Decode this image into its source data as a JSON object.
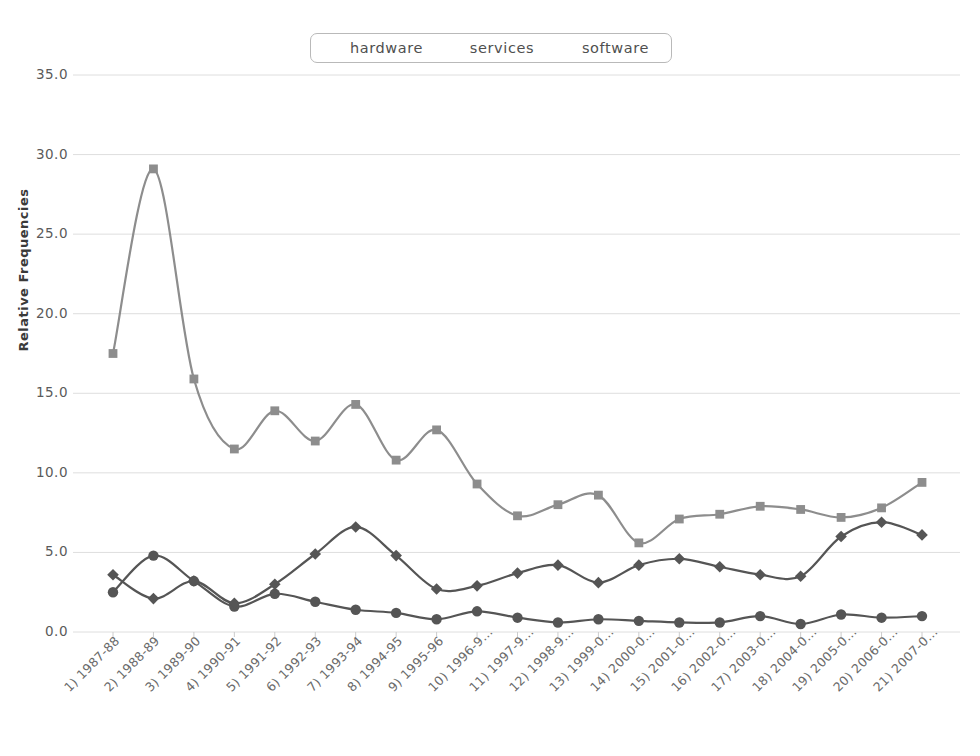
{
  "legend": {
    "position": "top-center",
    "items": [
      {
        "label": "hardware",
        "marker": "circle-marker",
        "color": "#555555"
      },
      {
        "label": "services",
        "marker": "diamond-marker",
        "color": "#555555"
      },
      {
        "label": "software",
        "marker": "square-marker",
        "color": "#8d8d8d"
      }
    ]
  },
  "axes": {
    "y_title": "Relative Frequencies",
    "y_ticks": [
      "0.0",
      "5.0",
      "10.0",
      "15.0",
      "20.0",
      "25.0",
      "30.0",
      "35.0"
    ]
  },
  "chart_data": {
    "type": "line",
    "title": "",
    "xlabel": "",
    "ylabel": "Relative Frequencies",
    "ylim": [
      0,
      35
    ],
    "ytick_step": 5,
    "grid": true,
    "legend_position": "top-center",
    "categories": [
      "1) 1987-88",
      "2) 1988-89",
      "3) 1989-90",
      "4) 1990-91",
      "5) 1991-92",
      "6) 1992-93",
      "7) 1993-94",
      "8) 1994-95",
      "9) 1995-96",
      "10) 1996-9...",
      "11) 1997-9...",
      "12) 1998-9...",
      "13) 1999-0...",
      "14) 2000-0...",
      "15) 2001-0...",
      "16) 2002-0...",
      "17) 2003-0...",
      "18) 2004-0...",
      "19) 2005-0...",
      "20) 2006-0...",
      "21) 2007-0..."
    ],
    "series": [
      {
        "name": "hardware",
        "color": "#555555",
        "marker": "circle",
        "values": [
          2.5,
          4.8,
          3.2,
          1.6,
          2.4,
          1.9,
          1.4,
          1.2,
          0.8,
          1.3,
          0.9,
          0.6,
          0.8,
          0.7,
          0.6,
          0.6,
          1.0,
          0.5,
          1.1,
          0.9,
          1.0
        ]
      },
      {
        "name": "services",
        "color": "#555555",
        "marker": "diamond",
        "values": [
          3.6,
          2.1,
          3.2,
          1.8,
          3.0,
          4.9,
          6.6,
          4.8,
          2.7,
          2.9,
          3.7,
          4.2,
          3.1,
          4.2,
          4.6,
          4.1,
          3.6,
          3.5,
          6.0,
          6.9,
          6.1
        ]
      },
      {
        "name": "software",
        "color": "#8d8d8d",
        "marker": "square",
        "values": [
          17.5,
          29.1,
          15.9,
          11.5,
          13.9,
          12.0,
          14.3,
          10.8,
          12.7,
          9.3,
          7.3,
          8.0,
          8.6,
          5.6,
          7.1,
          7.4,
          7.9,
          7.7,
          7.2,
          7.8,
          9.4
        ]
      }
    ]
  }
}
